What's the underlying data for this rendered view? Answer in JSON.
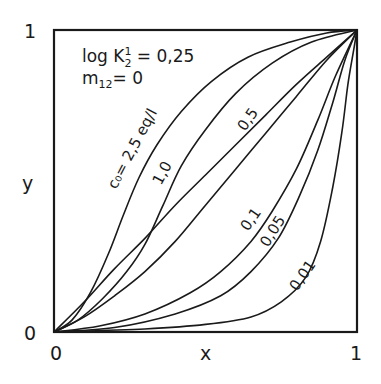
{
  "chart_data": {
    "type": "line",
    "title": "",
    "xlabel": "x",
    "ylabel": "y",
    "xlim": [
      0,
      1
    ],
    "ylim": [
      0,
      1
    ],
    "grid": false,
    "x_ticks": [
      "0",
      "1"
    ],
    "y_ticks": [
      "0",
      "1"
    ],
    "annotations": {
      "line1_main": "log K",
      "line1_sup": "1",
      "line1_sub": "2",
      "line1_value": " = 0,25",
      "line2_main": "m",
      "line2_sub": "12",
      "line2_value": "= 0"
    },
    "series": [
      {
        "name": "c0=2,5eq/l",
        "label": "c₀= 2,5 eq/l",
        "points": [
          [
            0,
            0
          ],
          [
            0.06,
            0.04
          ],
          [
            0.12,
            0.13
          ],
          [
            0.18,
            0.26
          ],
          [
            0.23,
            0.39
          ],
          [
            0.28,
            0.51
          ],
          [
            0.34,
            0.62
          ],
          [
            0.42,
            0.73
          ],
          [
            0.52,
            0.83
          ],
          [
            0.64,
            0.91
          ],
          [
            0.78,
            0.96
          ],
          [
            0.9,
            0.99
          ],
          [
            1,
            1
          ]
        ]
      },
      {
        "name": "1,0",
        "label": "1,0",
        "points": [
          [
            0,
            0
          ],
          [
            0.08,
            0.04
          ],
          [
            0.16,
            0.11
          ],
          [
            0.24,
            0.2
          ],
          [
            0.3,
            0.29
          ],
          [
            0.36,
            0.42
          ],
          [
            0.42,
            0.55
          ],
          [
            0.5,
            0.67
          ],
          [
            0.6,
            0.79
          ],
          [
            0.72,
            0.89
          ],
          [
            0.85,
            0.96
          ],
          [
            1,
            1
          ]
        ]
      },
      {
        "name": "diagonal",
        "label": "",
        "points": [
          [
            0,
            0
          ],
          [
            0.1,
            0.1
          ],
          [
            0.2,
            0.21
          ],
          [
            0.3,
            0.31
          ],
          [
            0.4,
            0.42
          ],
          [
            0.5,
            0.52
          ],
          [
            0.6,
            0.62
          ],
          [
            0.7,
            0.72
          ],
          [
            0.8,
            0.82
          ],
          [
            0.9,
            0.91
          ],
          [
            1,
            1
          ]
        ]
      },
      {
        "name": "0,5",
        "label": "0,5",
        "points": [
          [
            0,
            0
          ],
          [
            0.1,
            0.05
          ],
          [
            0.2,
            0.12
          ],
          [
            0.3,
            0.2
          ],
          [
            0.4,
            0.3
          ],
          [
            0.5,
            0.42
          ],
          [
            0.6,
            0.54
          ],
          [
            0.7,
            0.66
          ],
          [
            0.8,
            0.78
          ],
          [
            0.9,
            0.9
          ],
          [
            1,
            1
          ]
        ]
      },
      {
        "name": "0,1",
        "label": "0,1",
        "points": [
          [
            0,
            0
          ],
          [
            0.15,
            0.02
          ],
          [
            0.3,
            0.06
          ],
          [
            0.45,
            0.13
          ],
          [
            0.55,
            0.2
          ],
          [
            0.65,
            0.3
          ],
          [
            0.72,
            0.4
          ],
          [
            0.8,
            0.54
          ],
          [
            0.87,
            0.7
          ],
          [
            0.93,
            0.85
          ],
          [
            1,
            1
          ]
        ]
      },
      {
        "name": "0,05",
        "label": "0,05",
        "points": [
          [
            0,
            0
          ],
          [
            0.2,
            0.015
          ],
          [
            0.4,
            0.06
          ],
          [
            0.55,
            0.12
          ],
          [
            0.65,
            0.2
          ],
          [
            0.74,
            0.31
          ],
          [
            0.81,
            0.45
          ],
          [
            0.87,
            0.6
          ],
          [
            0.92,
            0.76
          ],
          [
            0.96,
            0.9
          ],
          [
            1,
            1
          ]
        ]
      },
      {
        "name": "0,01",
        "label": "0,01",
        "points": [
          [
            0,
            0
          ],
          [
            0.3,
            0.01
          ],
          [
            0.5,
            0.025
          ],
          [
            0.65,
            0.05
          ],
          [
            0.75,
            0.1
          ],
          [
            0.83,
            0.18
          ],
          [
            0.88,
            0.3
          ],
          [
            0.92,
            0.48
          ],
          [
            0.95,
            0.66
          ],
          [
            0.97,
            0.82
          ],
          [
            0.99,
            0.94
          ],
          [
            1,
            1
          ]
        ]
      }
    ]
  }
}
